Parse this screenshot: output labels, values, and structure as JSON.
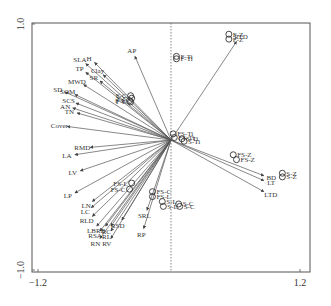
{
  "chart_data": {
    "type": "scatter",
    "subtype": "biplot",
    "title": "",
    "xlabel": "",
    "ylabel": "",
    "xlim": [
      -1.2,
      1.2
    ],
    "ylim": [
      -1.0,
      1.0
    ],
    "x_ticks": [
      "-1.2",
      "1.2"
    ],
    "y_ticks": [
      "1.0",
      "-1.0"
    ],
    "grid": false,
    "reference_line": {
      "orientation": "vertical",
      "x": 0,
      "style": "dashed"
    },
    "arrow_color": "#555555",
    "arrows": [
      {
        "label": "AP",
        "x": -0.33,
        "y": 0.68
      },
      {
        "label": "RTD",
        "x": 0.6,
        "y": 0.8
      },
      {
        "label": "SLA",
        "x": -0.78,
        "y": 0.62
      },
      {
        "label": "H",
        "x": -0.7,
        "y": 0.63
      },
      {
        "label": "TP",
        "x": -0.78,
        "y": 0.55
      },
      {
        "label": "Clay",
        "x": -0.62,
        "y": 0.53
      },
      {
        "label": "SR",
        "x": -0.65,
        "y": 0.48
      },
      {
        "label": "MWD",
        "x": -0.8,
        "y": 0.45
      },
      {
        "label": "SD",
        "x": -0.97,
        "y": 0.39
      },
      {
        "label": "SOM",
        "x": -0.88,
        "y": 0.37
      },
      {
        "label": "SCS",
        "x": -0.87,
        "y": 0.3
      },
      {
        "label": "AN",
        "x": -0.9,
        "y": 0.26
      },
      {
        "label": "TN",
        "x": -0.86,
        "y": 0.22
      },
      {
        "label": "Cover",
        "x": -0.95,
        "y": 0.11
      },
      {
        "label": "RMD",
        "x": -0.74,
        "y": -0.06
      },
      {
        "label": "LA",
        "x": -0.88,
        "y": -0.12
      },
      {
        "label": "LV",
        "x": -0.83,
        "y": -0.25
      },
      {
        "label": "LP",
        "x": -0.88,
        "y": -0.43
      },
      {
        "label": "LN",
        "x": -0.72,
        "y": -0.5
      },
      {
        "label": "LC",
        "x": -0.73,
        "y": -0.55
      },
      {
        "label": "RLD",
        "x": -0.72,
        "y": -0.62
      },
      {
        "label": "LB",
        "x": -0.68,
        "y": -0.7
      },
      {
        "label": "RB",
        "x": -0.6,
        "y": -0.7
      },
      {
        "label": "RC",
        "x": -0.55,
        "y": -0.7
      },
      {
        "label": "RSA",
        "x": -0.65,
        "y": -0.74
      },
      {
        "label": "RL",
        "x": -0.55,
        "y": -0.74
      },
      {
        "label": "RN",
        "x": -0.65,
        "y": -0.8
      },
      {
        "label": "RV",
        "x": -0.55,
        "y": -0.8
      },
      {
        "label": "RSD",
        "x": -0.45,
        "y": -0.65
      },
      {
        "label": "SRL",
        "x": -0.22,
        "y": -0.57
      },
      {
        "label": "RP",
        "x": -0.25,
        "y": -0.72
      },
      {
        "label": "BD",
        "x": 0.85,
        "y": -0.29
      },
      {
        "label": "LT",
        "x": 0.85,
        "y": -0.33
      },
      {
        "label": "LTD",
        "x": 0.85,
        "y": -0.42
      }
    ],
    "samples": [
      {
        "label": "F-Z",
        "x": 0.53,
        "y": 0.86
      },
      {
        "label": "F-Z",
        "x": 0.53,
        "y": 0.82
      },
      {
        "label": "F-Ti",
        "x": 0.05,
        "y": 0.68
      },
      {
        "label": "F-Ti",
        "x": 0.05,
        "y": 0.66
      },
      {
        "label": "F-C",
        "x": -0.37,
        "y": 0.36
      },
      {
        "label": "F-C",
        "x": -0.36,
        "y": 0.34
      },
      {
        "label": "F-L",
        "x": -0.38,
        "y": 0.32
      },
      {
        "label": "F-L",
        "x": -0.37,
        "y": 0.31
      },
      {
        "label": "FS-Ti",
        "x": 0.02,
        "y": 0.05
      },
      {
        "label": "FS-Ti",
        "x": 0.03,
        "y": 0.02
      },
      {
        "label": "S-Ti",
        "x": 0.1,
        "y": 0.01
      },
      {
        "label": "S-Ti",
        "x": 0.12,
        "y": -0.01
      },
      {
        "label": "FS-Z",
        "x": 0.57,
        "y": -0.12
      },
      {
        "label": "FS-Z",
        "x": 0.6,
        "y": -0.16
      },
      {
        "label": "S-Z",
        "x": 1.02,
        "y": -0.27
      },
      {
        "label": "S-Z",
        "x": 1.02,
        "y": -0.3
      },
      {
        "label": "FS-L",
        "x": -0.36,
        "y": -0.35
      },
      {
        "label": "FS-C",
        "x": -0.38,
        "y": -0.4
      },
      {
        "label": "FS-C",
        "x": -0.17,
        "y": -0.42
      },
      {
        "label": "FS-L",
        "x": -0.17,
        "y": -0.46
      },
      {
        "label": "S-L",
        "x": -0.08,
        "y": -0.5
      },
      {
        "label": "S-L",
        "x": -0.07,
        "y": -0.54
      },
      {
        "label": "S-C",
        "x": 0.07,
        "y": -0.52
      },
      {
        "label": "S-C",
        "x": 0.08,
        "y": -0.54
      }
    ]
  }
}
